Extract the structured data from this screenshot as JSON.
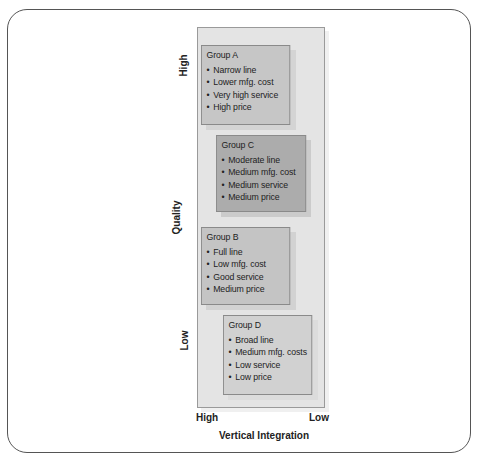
{
  "y_axis": {
    "title": "Quality",
    "high_label": "High",
    "low_label": "Low"
  },
  "x_axis": {
    "title": "Vertical Integration",
    "high_label": "High",
    "low_label": "Low"
  },
  "groups": [
    {
      "title": "Group A",
      "items": [
        "Narrow line",
        "Lower mfg. cost",
        "Very high service",
        "High price"
      ]
    },
    {
      "title": "Group C",
      "items": [
        "Moderate line",
        "Medium mfg. cost",
        "Medium service",
        "Medium price"
      ]
    },
    {
      "title": "Group B",
      "items": [
        "Full line",
        "Low mfg. cost",
        "Good service",
        "Medium price"
      ]
    },
    {
      "title": "Group D",
      "items": [
        "Broad line",
        "Medium mfg. costs",
        "Low service",
        "Low price"
      ]
    }
  ],
  "colors": {
    "panel": "#e4e4e4",
    "group_a": "#c6c6c6",
    "group_c": "#acacac",
    "group_b": "#c4c4c4",
    "group_d": "#d1d1d1"
  }
}
